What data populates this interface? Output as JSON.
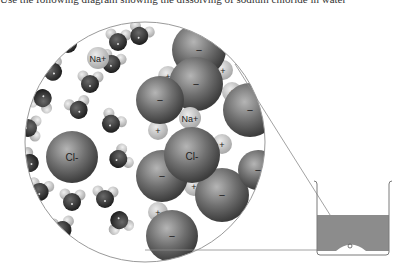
{
  "caption": "Use the following diagram showing the dissolving of sodium chloride in water",
  "labels": {
    "na_free": "Na+",
    "na_lattice": "Na+",
    "cl_free": "Cl-",
    "cl_lattice": "Cl-",
    "plus": "+",
    "minus": "−"
  },
  "colors": {
    "water_oxygen": "#3a3a3a",
    "water_hydrogen": "#c8c8c8",
    "chloride": "#6e6e6e",
    "sodium": "#c4c4c4",
    "solution": "#8c8c8c",
    "outline": "#9a9a9a"
  }
}
